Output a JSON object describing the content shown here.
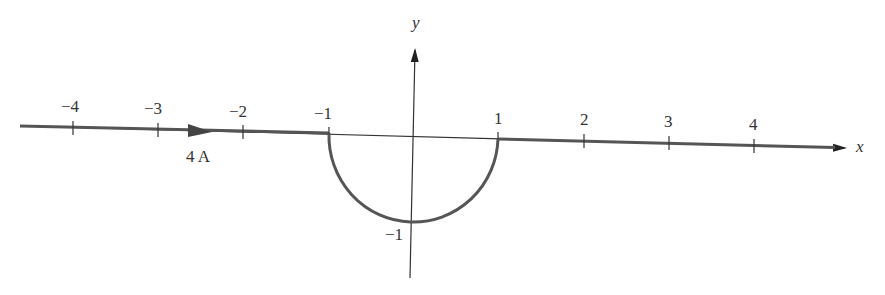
{
  "diagram": {
    "axes": {
      "x_label": "x",
      "y_label": "y",
      "x_ticks": [
        {
          "value": -4,
          "label": "−4"
        },
        {
          "value": -3,
          "label": "−3"
        },
        {
          "value": -2,
          "label": "−2"
        },
        {
          "value": -1,
          "label": "−1"
        },
        {
          "value": 1,
          "label": "1"
        },
        {
          "value": 2,
          "label": "2"
        },
        {
          "value": 3,
          "label": "3"
        },
        {
          "value": 4,
          "label": "4"
        }
      ],
      "y_ticks": [
        {
          "value": -1,
          "label": "−1"
        }
      ]
    },
    "wire": {
      "current_label": "4 A",
      "shape": "straight wire along x-axis with semicircular detour of radius 1 below the origin from x=-1 to x=1",
      "current_direction": "+x"
    },
    "colors": {
      "wire": "#555555",
      "axes": "#333333",
      "text": "#333333"
    }
  }
}
